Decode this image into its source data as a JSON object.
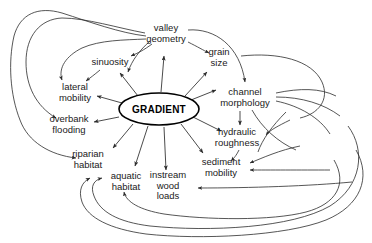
{
  "diagram": {
    "type": "concept-influence-diagram",
    "title": "",
    "background_color": "#ffffff",
    "line_color": "#2b2b2b",
    "text_color": "#1a1a1a",
    "hub": {
      "label": "GRADIENT",
      "cx": 159,
      "cy": 109,
      "rx": 40,
      "ry": 16
    },
    "nodes": [
      {
        "id": "valley-geometry",
        "label": "valley\ngeometry",
        "x": 166,
        "y": 33,
        "w": 44,
        "h": 22
      },
      {
        "id": "grain-size",
        "label": "grain\nsize",
        "x": 219,
        "y": 57,
        "w": 30,
        "h": 22
      },
      {
        "id": "sinuosity",
        "label": "sinuosity",
        "x": 110,
        "y": 62,
        "w": 42,
        "h": 11
      },
      {
        "id": "lateral-mobility",
        "label": "lateral\nmobility",
        "x": 75,
        "y": 92,
        "w": 40,
        "h": 22
      },
      {
        "id": "overbank-flooding",
        "label": "overbank\nflooding",
        "x": 69,
        "y": 124,
        "w": 46,
        "h": 22
      },
      {
        "id": "riparian-habitat",
        "label": "riparian\nhabitat",
        "x": 88,
        "y": 159,
        "w": 40,
        "h": 22
      },
      {
        "id": "aquatic-habitat",
        "label": "aquatic\nhabitat",
        "x": 126,
        "y": 181,
        "w": 40,
        "h": 22
      },
      {
        "id": "instream-wood",
        "label": "instream\nwood\nloads",
        "x": 168,
        "y": 186,
        "w": 42,
        "h": 33
      },
      {
        "id": "sediment-mobility",
        "label": "sediment\nmobility",
        "x": 221,
        "y": 167,
        "w": 44,
        "h": 22
      },
      {
        "id": "hydraulic-roughness",
        "label": "hydraulic\nroughness",
        "x": 237,
        "y": 137,
        "w": 48,
        "h": 22
      },
      {
        "id": "channel-morphology",
        "label": "channel\nmorphology",
        "x": 245,
        "y": 97,
        "w": 54,
        "h": 22
      }
    ],
    "hub_edges": [
      {
        "from": "GRADIENT",
        "to": "valley-geometry"
      },
      {
        "from": "GRADIENT",
        "to": "grain-size"
      },
      {
        "from": "GRADIENT",
        "to": "sinuosity"
      },
      {
        "from": "GRADIENT",
        "to": "lateral-mobility"
      },
      {
        "from": "GRADIENT",
        "to": "overbank-flooding"
      },
      {
        "from": "GRADIENT",
        "to": "riparian-habitat"
      },
      {
        "from": "GRADIENT",
        "to": "aquatic-habitat"
      },
      {
        "from": "GRADIENT",
        "to": "instream-wood"
      },
      {
        "from": "GRADIENT",
        "to": "sediment-mobility"
      },
      {
        "from": "GRADIENT",
        "to": "hydraulic-roughness"
      },
      {
        "from": "GRADIENT",
        "to": "channel-morphology"
      }
    ],
    "direct_edges": [
      {
        "from": "valley-geometry",
        "to": "sinuosity"
      },
      {
        "from": "valley-geometry",
        "to": "grain-size"
      },
      {
        "from": "valley-geometry",
        "to": "channel-morphology"
      },
      {
        "from": "valley-geometry",
        "to": "lateral-mobility"
      },
      {
        "from": "valley-geometry",
        "to": "overbank-flooding"
      },
      {
        "from": "valley-geometry",
        "to": "riparian-habitat"
      },
      {
        "from": "channel-morphology",
        "to": "hydraulic-roughness"
      },
      {
        "from": "hydraulic-roughness",
        "to": "sediment-mobility"
      },
      {
        "from": "channel-morphology",
        "to": "sediment-mobility"
      },
      {
        "from": "channel-morphology",
        "to": "instream-wood"
      },
      {
        "from": "channel-morphology",
        "to": "aquatic-habitat"
      },
      {
        "from": "channel-morphology",
        "to": "riparian-habitat"
      },
      {
        "from": "sinuosity",
        "to": "lateral-mobility"
      },
      {
        "from": "sediment-mobility",
        "to": "valley-geometry"
      },
      {
        "from": "grain-size",
        "to": "valley-geometry"
      }
    ]
  }
}
